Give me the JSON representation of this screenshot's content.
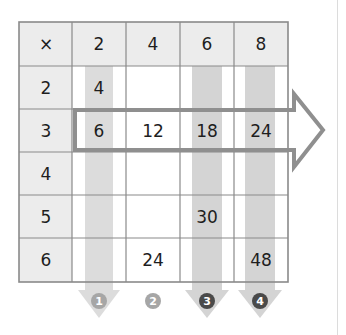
{
  "table": {
    "operator": "×",
    "column_headers": [
      "2",
      "4",
      "6",
      "8"
    ],
    "row_headers": [
      "2",
      "3",
      "4",
      "5",
      "6"
    ],
    "cells": [
      [
        "4",
        "",
        "",
        ""
      ],
      [
        "6",
        "12",
        "18",
        "24"
      ],
      [
        "",
        "",
        "",
        ""
      ],
      [
        "",
        "",
        "30",
        ""
      ],
      [
        "",
        "24",
        "",
        "48"
      ]
    ]
  },
  "highlights": {
    "row_arrow_row": "3",
    "shaded_columns": [
      "2",
      "6",
      "8"
    ]
  },
  "step_markers": [
    {
      "label": "1",
      "style": "light",
      "has_arrow": true
    },
    {
      "label": "2",
      "style": "light",
      "has_arrow": false
    },
    {
      "label": "3",
      "style": "dark",
      "has_arrow": true
    },
    {
      "label": "4",
      "style": "dark",
      "has_arrow": true
    }
  ],
  "colors": {
    "header_bg": "#ececec",
    "grid_line": "#8a8a8a",
    "band": "#d9d9d9",
    "arrow_outline": "#8f8f8f",
    "marker_light": "#a6a6a6",
    "marker_dark": "#4a4a4a",
    "text": "#1e1e1e"
  }
}
